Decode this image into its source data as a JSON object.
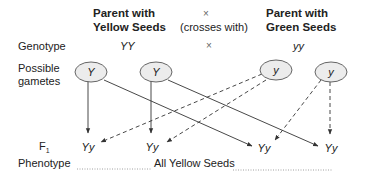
{
  "header": {
    "parent1_line1": "Parent with",
    "parent1_line2": "Yellow Seeds",
    "cross_symbol": "×",
    "cross_text": "(crosses with)",
    "parent2_line1": "Parent with",
    "parent2_line2": "Green Seeds"
  },
  "rows": {
    "genotype_label": "Genotype",
    "genotype_parent1": "YY",
    "genotype_cross": "×",
    "genotype_parent2": "yy",
    "gametes_label_line1": "Possible",
    "gametes_label_line2": "gametes",
    "f1_label": "F",
    "f1_subscript": "1",
    "phenotype_label": "Phenotype",
    "phenotype_value": "All Yellow Seeds"
  },
  "gametes": [
    "Y",
    "Y",
    "y",
    "y"
  ],
  "offspring": [
    "Yy",
    "Yy",
    "Yy",
    "Yy"
  ],
  "colors": {
    "ellipse_fill": "#ececec",
    "ellipse_stroke": "#555555",
    "line": "#333333",
    "dotted_line": "#888888"
  }
}
